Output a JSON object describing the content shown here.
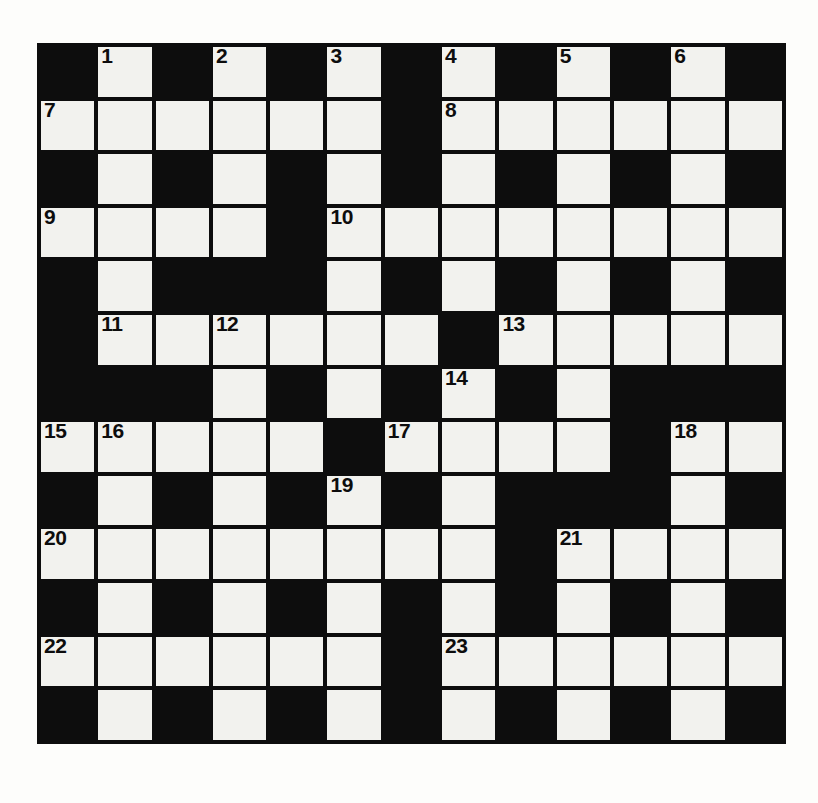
{
  "page": {
    "background_color": "#fdfdfb"
  },
  "crossword": {
    "name": "crossword-grid",
    "rows": 13,
    "columns": 13,
    "block_color": "#0d0d0d",
    "light_color": "#f2f2ee",
    "number_color": "#0d0d0d",
    "cells_filled": false,
    "highest_clue_number": 23,
    "clue_numbers_visible": [
      "1",
      "2",
      "3",
      "4",
      "5",
      "6",
      "7",
      "8",
      "9",
      "10",
      "11",
      "12",
      "13",
      "14",
      "15",
      "16",
      "17",
      "18",
      "19",
      "20",
      "21",
      "22",
      "23"
    ],
    "grid": [
      [
        {
          "type": "block"
        },
        {
          "type": "light",
          "number": "1"
        },
        {
          "type": "block"
        },
        {
          "type": "light",
          "number": "2"
        },
        {
          "type": "block"
        },
        {
          "type": "light",
          "number": "3"
        },
        {
          "type": "block"
        },
        {
          "type": "light",
          "number": "4"
        },
        {
          "type": "block"
        },
        {
          "type": "light",
          "number": "5"
        },
        {
          "type": "block"
        },
        {
          "type": "light",
          "number": "6"
        },
        {
          "type": "block"
        }
      ],
      [
        {
          "type": "light",
          "number": "7"
        },
        {
          "type": "light"
        },
        {
          "type": "light"
        },
        {
          "type": "light"
        },
        {
          "type": "light"
        },
        {
          "type": "light"
        },
        {
          "type": "block"
        },
        {
          "type": "light",
          "number": "8"
        },
        {
          "type": "light"
        },
        {
          "type": "light"
        },
        {
          "type": "light"
        },
        {
          "type": "light"
        },
        {
          "type": "light"
        }
      ],
      [
        {
          "type": "block"
        },
        {
          "type": "light"
        },
        {
          "type": "block"
        },
        {
          "type": "light"
        },
        {
          "type": "block"
        },
        {
          "type": "light"
        },
        {
          "type": "block"
        },
        {
          "type": "light"
        },
        {
          "type": "block"
        },
        {
          "type": "light"
        },
        {
          "type": "block"
        },
        {
          "type": "light"
        },
        {
          "type": "block"
        }
      ],
      [
        {
          "type": "light",
          "number": "9"
        },
        {
          "type": "light"
        },
        {
          "type": "light"
        },
        {
          "type": "light"
        },
        {
          "type": "block"
        },
        {
          "type": "light",
          "number": "10"
        },
        {
          "type": "light"
        },
        {
          "type": "light"
        },
        {
          "type": "light"
        },
        {
          "type": "light"
        },
        {
          "type": "light"
        },
        {
          "type": "light"
        },
        {
          "type": "light"
        }
      ],
      [
        {
          "type": "block"
        },
        {
          "type": "light"
        },
        {
          "type": "block"
        },
        {
          "type": "block"
        },
        {
          "type": "block"
        },
        {
          "type": "light"
        },
        {
          "type": "block"
        },
        {
          "type": "light"
        },
        {
          "type": "block"
        },
        {
          "type": "light"
        },
        {
          "type": "block"
        },
        {
          "type": "light"
        },
        {
          "type": "block"
        }
      ],
      [
        {
          "type": "block"
        },
        {
          "type": "light",
          "number": "11"
        },
        {
          "type": "light"
        },
        {
          "type": "light",
          "number": "12"
        },
        {
          "type": "light"
        },
        {
          "type": "light"
        },
        {
          "type": "light"
        },
        {
          "type": "block"
        },
        {
          "type": "light",
          "number": "13"
        },
        {
          "type": "light"
        },
        {
          "type": "light"
        },
        {
          "type": "light"
        },
        {
          "type": "light"
        }
      ],
      [
        {
          "type": "block"
        },
        {
          "type": "block"
        },
        {
          "type": "block"
        },
        {
          "type": "light"
        },
        {
          "type": "block"
        },
        {
          "type": "light"
        },
        {
          "type": "block"
        },
        {
          "type": "light",
          "number": "14"
        },
        {
          "type": "block"
        },
        {
          "type": "light"
        },
        {
          "type": "block"
        },
        {
          "type": "block"
        },
        {
          "type": "block"
        }
      ],
      [
        {
          "type": "light",
          "number": "15"
        },
        {
          "type": "light",
          "number": "16"
        },
        {
          "type": "light"
        },
        {
          "type": "light"
        },
        {
          "type": "light"
        },
        {
          "type": "block"
        },
        {
          "type": "light",
          "number": "17"
        },
        {
          "type": "light"
        },
        {
          "type": "light"
        },
        {
          "type": "light"
        },
        {
          "type": "block"
        },
        {
          "type": "light",
          "number": "18"
        },
        {
          "type": "light"
        }
      ],
      [
        {
          "type": "block"
        },
        {
          "type": "light"
        },
        {
          "type": "block"
        },
        {
          "type": "light"
        },
        {
          "type": "block"
        },
        {
          "type": "light",
          "number": "19"
        },
        {
          "type": "block"
        },
        {
          "type": "light"
        },
        {
          "type": "block"
        },
        {
          "type": "block"
        },
        {
          "type": "block"
        },
        {
          "type": "light"
        },
        {
          "type": "block"
        }
      ],
      [
        {
          "type": "light",
          "number": "20"
        },
        {
          "type": "light"
        },
        {
          "type": "light"
        },
        {
          "type": "light"
        },
        {
          "type": "light"
        },
        {
          "type": "light"
        },
        {
          "type": "light"
        },
        {
          "type": "light"
        },
        {
          "type": "block"
        },
        {
          "type": "light",
          "number": "21"
        },
        {
          "type": "light"
        },
        {
          "type": "light"
        },
        {
          "type": "light"
        }
      ],
      [
        {
          "type": "block"
        },
        {
          "type": "light"
        },
        {
          "type": "block"
        },
        {
          "type": "light"
        },
        {
          "type": "block"
        },
        {
          "type": "light"
        },
        {
          "type": "block"
        },
        {
          "type": "light"
        },
        {
          "type": "block"
        },
        {
          "type": "light"
        },
        {
          "type": "block"
        },
        {
          "type": "light"
        },
        {
          "type": "block"
        }
      ],
      [
        {
          "type": "light",
          "number": "22"
        },
        {
          "type": "light"
        },
        {
          "type": "light"
        },
        {
          "type": "light"
        },
        {
          "type": "light"
        },
        {
          "type": "light"
        },
        {
          "type": "block"
        },
        {
          "type": "light",
          "number": "23"
        },
        {
          "type": "light"
        },
        {
          "type": "light"
        },
        {
          "type": "light"
        },
        {
          "type": "light"
        },
        {
          "type": "light"
        }
      ],
      [
        {
          "type": "block"
        },
        {
          "type": "light"
        },
        {
          "type": "block"
        },
        {
          "type": "light"
        },
        {
          "type": "block"
        },
        {
          "type": "light"
        },
        {
          "type": "block"
        },
        {
          "type": "light"
        },
        {
          "type": "block"
        },
        {
          "type": "light"
        },
        {
          "type": "block"
        },
        {
          "type": "light"
        },
        {
          "type": "block"
        }
      ]
    ]
  }
}
